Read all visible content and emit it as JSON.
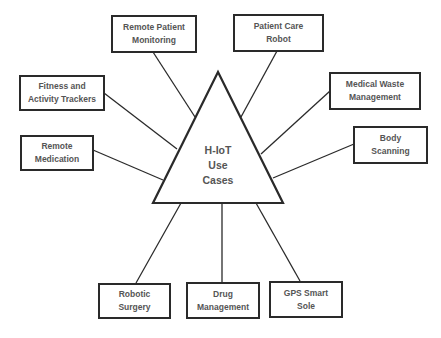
{
  "diagram": {
    "center": {
      "label": "H-IoT\nUse\nCases",
      "shape": "triangle"
    },
    "colors": {
      "stroke": "#2a2a2a",
      "text": "#555555",
      "background": "#ffffff"
    },
    "nodes": [
      {
        "id": "remote-patient-monitoring",
        "label": "Remote Patient\nMonitoring"
      },
      {
        "id": "patient-care-robot",
        "label": "Patient Care\nRobot"
      },
      {
        "id": "fitness-activity-trackers",
        "label": "Fitness and\nActivity Trackers"
      },
      {
        "id": "medical-waste-management",
        "label": "Medical Waste\nManagement"
      },
      {
        "id": "remote-medication",
        "label": "Remote\nMedication"
      },
      {
        "id": "body-scanning",
        "label": "Body\nScanning"
      },
      {
        "id": "robotic-surgery",
        "label": "Robotic\nSurgery"
      },
      {
        "id": "drug-management",
        "label": "Drug\nManagement"
      },
      {
        "id": "gps-smart-sole",
        "label": "GPS Smart\nSole"
      }
    ]
  }
}
